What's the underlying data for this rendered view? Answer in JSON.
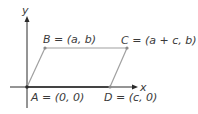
{
  "diagram": {
    "type": "coordinate-parallelogram",
    "axes": {
      "x_label": "x",
      "y_label": "y"
    },
    "points": [
      {
        "id": "A",
        "name": "A",
        "coords_text": "(0, 0)",
        "label": "A = (0, 0)"
      },
      {
        "id": "B",
        "name": "B",
        "coords_text": "(a, b)",
        "label": "B = (a, b)"
      },
      {
        "id": "C",
        "name": "C",
        "coords_text": "(a + c, b)",
        "label": "C = (a + c, b)"
      },
      {
        "id": "D",
        "name": "D",
        "coords_text": "(c, 0)",
        "label": "D = (c, 0)"
      }
    ],
    "colors": {
      "axis": "#2a2a2a",
      "shape": "#a0a0a0",
      "point": "#8a8a8a",
      "text": "#3a3a3a"
    }
  }
}
